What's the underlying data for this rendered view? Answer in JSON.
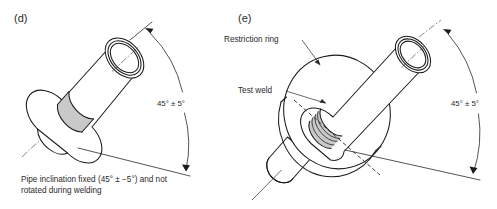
{
  "figure": {
    "background_color": "#ffffff",
    "line_color": "#1b1b1b",
    "weld_fill_color": "#c9c9c9"
  },
  "panels": [
    {
      "id": "d",
      "label": "(d)",
      "dimension_label": "45° ± 5°",
      "caption_line1": "Pipe inclination fixed (45° ± −5°) and not",
      "caption_line2": "rotated during welding",
      "elements": {
        "pipe": "inclined-pipe",
        "weld": "test-weld-band",
        "angle_arc": "45-degree-arc"
      }
    },
    {
      "id": "e",
      "label": "(e)",
      "dimension_label": "45° ± 5°",
      "annotations": [
        {
          "name": "restriction-ring",
          "text": "Restriction ring"
        },
        {
          "name": "test-weld",
          "text": "Test weld"
        }
      ],
      "elements": {
        "ring": "restriction-ring-disc",
        "pipe": "inclined-pipe",
        "weld": "test-weld-bead",
        "angle_arc": "45-degree-arc"
      }
    }
  ]
}
